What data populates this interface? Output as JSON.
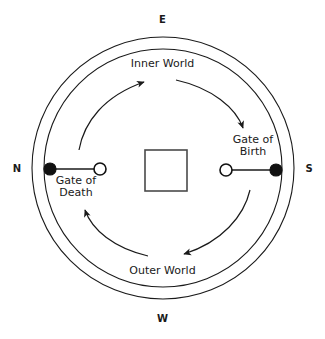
{
  "diagram": {
    "background_color": "#ffffff",
    "stroke_color": "#1a1a1a",
    "compass": {
      "top": "E",
      "right": "S",
      "bottom": "W",
      "left": "N"
    },
    "rings": {
      "outer_circle": {
        "cx": 163,
        "cy": 168,
        "r": 131
      },
      "inner_circle": {
        "cx": 163,
        "cy": 168,
        "r": 119
      },
      "center_square": {
        "x": 145,
        "y": 150,
        "w": 42,
        "h": 41
      }
    },
    "bands": [
      {
        "name": "inner-world",
        "label": "Inner World"
      },
      {
        "name": "outer-world",
        "label": "Outer World"
      }
    ],
    "gates": [
      {
        "name": "gate-of-death",
        "label_line1": "Gate of",
        "label_line2": "Death",
        "side": "left",
        "filled_node": {
          "cx": 50,
          "cy": 169,
          "r": 6
        },
        "open_node": {
          "cx": 100,
          "cy": 169,
          "r": 6
        }
      },
      {
        "name": "gate-of-birth",
        "label_line1": "Gate of",
        "label_line2": "Birth",
        "side": "right",
        "open_node": {
          "cx": 226,
          "cy": 170,
          "r": 6
        },
        "filled_node": {
          "cx": 276,
          "cy": 170,
          "r": 6
        }
      }
    ],
    "flow_arrows": [
      {
        "name": "arrow-inner-ascending-left",
        "direction": "clockwise-upward",
        "tip": "upper-left-to-top"
      },
      {
        "name": "arrow-inner-descending-right",
        "direction": "clockwise-downward",
        "tip": "top-to-right"
      },
      {
        "name": "arrow-outer-descending-right",
        "direction": "clockwise-downward",
        "tip": "right-to-bottom"
      },
      {
        "name": "arrow-outer-ascending-left",
        "direction": "clockwise-upward",
        "tip": "bottom-to-left"
      }
    ]
  }
}
